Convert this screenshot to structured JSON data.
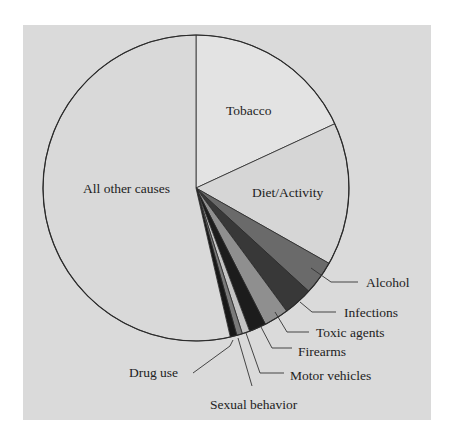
{
  "chart_data": {
    "type": "pie",
    "title": "",
    "start_angle_deg": 0,
    "direction": "clockwise",
    "slices": [
      {
        "label": "Tobacco",
        "value": 18.1,
        "color": "#e3e3e3"
      },
      {
        "label": "Diet/Activity",
        "value": 15.1,
        "color": "#d6d6d6"
      },
      {
        "label": "Alcohol",
        "value": 3.6,
        "color": "#6a6a6a"
      },
      {
        "label": "Infections",
        "value": 3.1,
        "color": "#383838"
      },
      {
        "label": "Toxic agents",
        "value": 2.6,
        "color": "#8f8f8f"
      },
      {
        "label": "Firearms",
        "value": 1.8,
        "color": "#1c1c1c"
      },
      {
        "label": "Motor vehicles",
        "value": 0.8,
        "color": "#c4c4c4"
      },
      {
        "label": "Sexual behavior",
        "value": 0.6,
        "color": "#7a7a7a"
      },
      {
        "label": "Drug use",
        "value": 0.7,
        "color": "#181818"
      },
      {
        "label": "All other causes",
        "value": 53.6,
        "color": "#d9d9d9"
      }
    ]
  },
  "labels": {
    "tobacco": "Tobacco",
    "diet": "Diet/Activity",
    "other": "All other causes",
    "alcohol": "Alcohol",
    "infections": "Infections",
    "toxic": "Toxic agents",
    "firearms": "Firearms",
    "motor": "Motor vehicles",
    "sexual": "Sexual behavior",
    "drug": "Drug use"
  },
  "colors": {
    "panel": "#dadada",
    "outline": "#2a2a2a",
    "leader": "#333333"
  }
}
